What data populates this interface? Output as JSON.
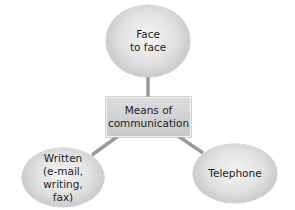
{
  "diagram": {
    "center": {
      "label": "Means of\ncommunication"
    },
    "nodes": [
      {
        "id": "face",
        "label": "Face\nto face"
      },
      {
        "id": "written",
        "label": "Written\n(e-mail, writing,\nfax)"
      },
      {
        "id": "telephone",
        "label": "Telephone"
      }
    ],
    "colors": {
      "node_fill_center": "#f4f4f4",
      "node_fill_edge": "#ababab",
      "connector": "#9a9a9a",
      "text": "#222222"
    }
  }
}
